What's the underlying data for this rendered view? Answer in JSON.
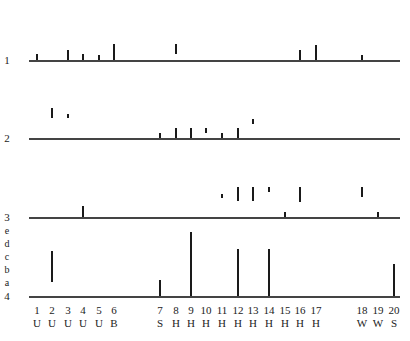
{
  "chart_data": {
    "type": "event-raster",
    "rows": [
      {
        "label": "1",
        "bars": [
          {
            "x": 1,
            "from": 0,
            "to": 0.45
          },
          {
            "x": 3,
            "from": 0,
            "to": 0.75
          },
          {
            "x": 4,
            "from": 0,
            "to": 0.45
          },
          {
            "x": 5,
            "from": 0,
            "to": 0.4
          },
          {
            "x": 6,
            "from": 0,
            "to": 1.2
          },
          {
            "x": 8,
            "from": 0.45,
            "to": 1.2
          },
          {
            "x": 16,
            "from": 0,
            "to": 0.75
          },
          {
            "x": 17,
            "from": 0,
            "to": 1.15
          },
          {
            "x": 18,
            "from": 0,
            "to": 0.4
          }
        ]
      },
      {
        "label": "2",
        "bars": [
          {
            "x": 2,
            "from": 1.55,
            "to": 2.3
          },
          {
            "x": 3,
            "from": 1.55,
            "to": 1.85
          },
          {
            "x": 7,
            "from": 0,
            "to": 0.4
          },
          {
            "x": 8,
            "from": 0,
            "to": 0.75
          },
          {
            "x": 9,
            "from": 0,
            "to": 0.75
          },
          {
            "x": 10,
            "from": 0.4,
            "to": 0.75
          },
          {
            "x": 11,
            "from": 0,
            "to": 0.4
          },
          {
            "x": 12,
            "from": 0,
            "to": 0.75
          },
          {
            "x": 13,
            "from": 1.1,
            "to": 1.5
          }
        ]
      },
      {
        "label": "3",
        "bars": [
          {
            "x": 4,
            "from": 0,
            "to": 0.85
          },
          {
            "x": 11,
            "from": 1.45,
            "to": 1.8
          },
          {
            "x": 12,
            "from": 1.2,
            "to": 2.3
          },
          {
            "x": 13,
            "from": 1.2,
            "to": 2.3
          },
          {
            "x": 14,
            "from": 1.95,
            "to": 2.3
          },
          {
            "x": 15,
            "from": 0,
            "to": 0.35
          },
          {
            "x": 16,
            "from": 1.15,
            "to": 2.3
          },
          {
            "x": 18,
            "from": 1.55,
            "to": 2.3
          },
          {
            "x": 19,
            "from": 0,
            "to": 0.35
          }
        ]
      },
      {
        "label": "4",
        "bars": [
          {
            "x": 2,
            "from": 1.05,
            "to": 3.5
          },
          {
            "x": 7,
            "from": 0,
            "to": 1.25
          },
          {
            "x": 9,
            "from": 0,
            "to": 4.9
          },
          {
            "x": 12,
            "from": 0,
            "to": 3.6
          },
          {
            "x": 14,
            "from": 0,
            "to": 3.6
          },
          {
            "x": 20,
            "from": 0,
            "to": 2.5
          }
        ]
      }
    ],
    "y_levels_row4": [
      "a",
      "b",
      "c",
      "d",
      "e"
    ],
    "x_ticks": [
      {
        "num": "1",
        "cat": "U"
      },
      {
        "num": "2",
        "cat": "U"
      },
      {
        "num": "3",
        "cat": "U"
      },
      {
        "num": "4",
        "cat": "U"
      },
      {
        "num": "5",
        "cat": "U"
      },
      {
        "num": "6",
        "cat": "B"
      },
      {
        "num": "7",
        "cat": "S"
      },
      {
        "num": "8",
        "cat": "H"
      },
      {
        "num": "9",
        "cat": "H"
      },
      {
        "num": "10",
        "cat": "H"
      },
      {
        "num": "11",
        "cat": "H"
      },
      {
        "num": "12",
        "cat": "H"
      },
      {
        "num": "13",
        "cat": "H"
      },
      {
        "num": "14",
        "cat": "H"
      },
      {
        "num": "15",
        "cat": "H"
      },
      {
        "num": "16",
        "cat": "H"
      },
      {
        "num": "17",
        "cat": "H"
      },
      {
        "num": "18",
        "cat": "W"
      },
      {
        "num": "19",
        "cat": "W"
      },
      {
        "num": "20",
        "cat": "S"
      }
    ],
    "title": "",
    "xlabel": "",
    "ylabel": "",
    "grid": false,
    "legend": "none"
  },
  "layout": {
    "x_pos": [
      37,
      52,
      68,
      83,
      99,
      114,
      160,
      176,
      191,
      206,
      222,
      238,
      253,
      269,
      285,
      300,
      316,
      362,
      378,
      394
    ],
    "row_baseline_y": [
      60,
      138,
      217,
      296
    ],
    "unit_px": 13,
    "axis_x_start": 29,
    "axis_x_end": 400
  }
}
